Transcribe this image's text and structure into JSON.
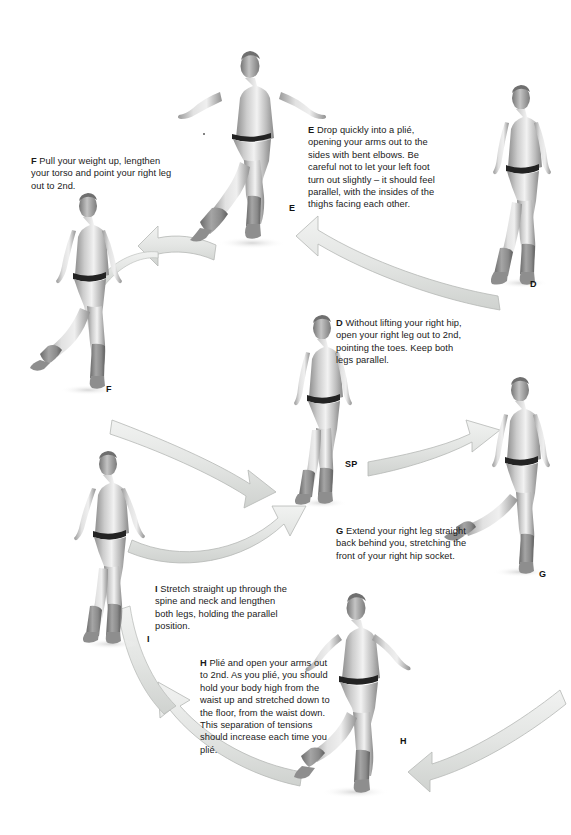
{
  "page": {
    "background_color": "#ffffff",
    "width": 571,
    "height": 835
  },
  "colors": {
    "text": "#1a1a1a",
    "figure_mid": "#b9b9b9",
    "figure_dark": "#6e6e6e",
    "figure_light": "#e6e6e6",
    "arrow_fill": "#e2e4e2",
    "arrow_stroke": "#b0b4b0",
    "belt": "#2b2b2b"
  },
  "captions": [
    {
      "id": "caption-e",
      "lead": "E",
      "text": " Drop quickly into a plié, opening your arms out to the sides with bent elbows. Be careful not to let your left foot turn out slightly – it should feel parallel, with the insides of the thighs facing each other.",
      "x": 308,
      "y": 124,
      "width": 128
    },
    {
      "id": "caption-f",
      "lead": "F",
      "text": " Pull your weight up, lengthen your torso and point your right leg out to 2nd.",
      "x": 31,
      "y": 155,
      "width": 150
    },
    {
      "id": "caption-d",
      "lead": "D",
      "text": " Without lifting your right hip, open your right leg out to 2nd, pointing the toes. Keep both legs parallel.",
      "x": 336,
      "y": 317,
      "width": 133
    },
    {
      "id": "caption-g",
      "lead": "G",
      "text": " Extend your right leg straight back behind you, stretching the front of your right hip socket.",
      "x": 336,
      "y": 525,
      "width": 132
    },
    {
      "id": "caption-i",
      "lead": "I",
      "text": " Stretch straight up through the spine and neck and lengthen both legs, holding the parallel position.",
      "x": 155,
      "y": 583,
      "width": 140
    },
    {
      "id": "caption-h",
      "lead": "H",
      "text": " Plié and open your arms out to 2nd. As you plié, you should hold your body high from the waist up and stretched down to the floor, from the waist down. This separation of tensions should increase each time you plié.",
      "x": 200,
      "y": 657,
      "width": 130
    }
  ],
  "figure_labels": [
    {
      "id": "label-e",
      "text": "E",
      "x": 289,
      "y": 203
    },
    {
      "id": "label-d",
      "text": "D",
      "x": 530,
      "y": 279
    },
    {
      "id": "label-f",
      "text": "F",
      "x": 106,
      "y": 384
    },
    {
      "id": "label-sp",
      "text": "SP",
      "x": 345,
      "y": 459
    },
    {
      "id": "label-g",
      "text": "G",
      "x": 539,
      "y": 569
    },
    {
      "id": "label-i",
      "text": "I",
      "x": 147,
      "y": 634
    },
    {
      "id": "label-h",
      "text": "H",
      "x": 400,
      "y": 736
    }
  ],
  "figures": [
    {
      "id": "figure-e",
      "name": "dancer-plie-arms-second",
      "label": "E",
      "x": 215,
      "y": 55,
      "width": 110,
      "height": 190
    },
    {
      "id": "figure-d",
      "name": "dancer-leg-out-second",
      "label": "D",
      "x": 482,
      "y": 85,
      "width": 85,
      "height": 200
    },
    {
      "id": "figure-f",
      "name": "dancer-weight-up-point",
      "label": "F",
      "x": 48,
      "y": 192,
      "width": 95,
      "height": 200
    },
    {
      "id": "figure-sp",
      "name": "dancer-start-position",
      "label": "SP",
      "x": 282,
      "y": 315,
      "width": 85,
      "height": 190
    },
    {
      "id": "figure-g",
      "name": "dancer-leg-extended-back",
      "label": "G",
      "x": 480,
      "y": 375,
      "width": 90,
      "height": 200
    },
    {
      "id": "figure-i",
      "name": "dancer-stretch-up-parallel",
      "label": "I",
      "x": 65,
      "y": 450,
      "width": 95,
      "height": 195
    },
    {
      "id": "figure-h",
      "name": "dancer-plie-arms-open",
      "label": "H",
      "x": 300,
      "y": 595,
      "width": 105,
      "height": 200
    }
  ],
  "arrows": [
    {
      "id": "arrow-d-to-e",
      "name": "arrow-d-to-e",
      "from": "D",
      "to": "E",
      "direction": "leftward-curve"
    },
    {
      "id": "arrow-e-to-f",
      "name": "arrow-e-to-f",
      "from": "E",
      "to": "F",
      "direction": "leftward-curve"
    },
    {
      "id": "arrow-f-to-sp",
      "name": "arrow-f-to-sp",
      "from": "F",
      "to": "SP",
      "direction": "rightward-curve"
    },
    {
      "id": "arrow-sp-to-g",
      "name": "arrow-sp-to-g",
      "from": "SP",
      "to": "G",
      "direction": "rightward-curve"
    },
    {
      "id": "arrow-g-to-h",
      "name": "arrow-g-to-h",
      "from": "G",
      "to": "H",
      "direction": "leftward-curve"
    },
    {
      "id": "arrow-h-to-i",
      "name": "arrow-h-to-i",
      "from": "H",
      "to": "I",
      "direction": "leftward-curve"
    },
    {
      "id": "arrow-i-to-sp",
      "name": "arrow-i-to-sp",
      "from": "I",
      "to": "SP",
      "direction": "rightward-curve"
    }
  ]
}
